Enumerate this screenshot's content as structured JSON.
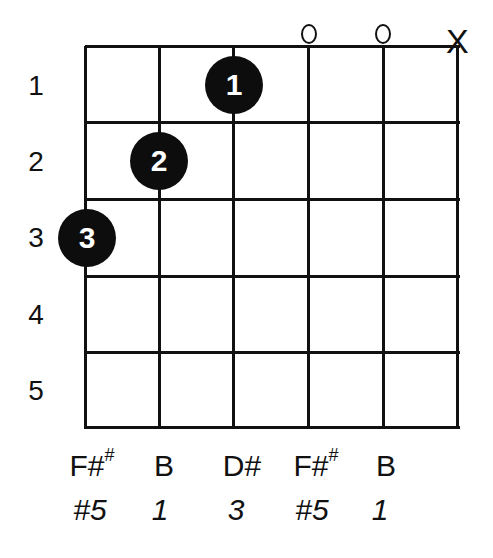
{
  "chart": {
    "title": "",
    "fret_numbers": [
      "1",
      "2",
      "3",
      "4",
      "5"
    ],
    "strings_marker": [
      {
        "string": 6,
        "marker": ""
      },
      {
        "string": 5,
        "marker": ""
      },
      {
        "string": 4,
        "marker": ""
      },
      {
        "string": 3,
        "marker": "o"
      },
      {
        "string": 2,
        "marker": "o"
      },
      {
        "string": 1,
        "marker": "X"
      }
    ],
    "fingers": [
      {
        "label": "1",
        "string": 4,
        "fret": 1
      },
      {
        "label": "2",
        "string": 5,
        "fret": 2
      },
      {
        "label": "3",
        "string": 6,
        "fret": 3
      }
    ],
    "notes": [
      "F#",
      "B",
      "D#",
      "F#",
      "B"
    ],
    "note_sups": [
      "#",
      "",
      "",
      "#",
      ""
    ],
    "intervals": [
      "#5",
      "1",
      "3",
      "#5",
      "1"
    ]
  }
}
